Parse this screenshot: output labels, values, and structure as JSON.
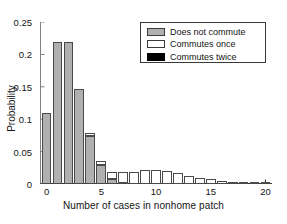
{
  "chart_data": {
    "type": "bar",
    "title": "",
    "subtitle": "",
    "xlabel": "Number of cases in nonhome patch",
    "ylabel": "Probability",
    "xlim": [
      -0.6,
      20.6
    ],
    "ylim": [
      0,
      0.25
    ],
    "xticks": [
      0,
      5,
      10,
      15,
      20
    ],
    "xticklabels": [
      "0",
      "5",
      "10",
      "15",
      "20"
    ],
    "yticks": [
      0,
      0.05,
      0.1,
      0.15,
      0.2,
      0.25
    ],
    "yticklabels": [
      "0",
      "0.05",
      "0.1",
      "0.15",
      "0.2",
      "0.25"
    ],
    "grid": false,
    "stacked": true,
    "legend_position": "upper right",
    "categories": [
      0,
      1,
      2,
      3,
      4,
      5,
      6,
      7,
      8,
      9,
      10,
      11,
      12,
      13,
      14,
      15,
      16,
      17,
      18,
      19,
      20
    ],
    "series": [
      {
        "name": "Does not commute",
        "color": "#b0b0b0",
        "values": [
          0.11,
          0.219,
          0.219,
          0.147,
          0.074,
          0.029,
          0.008,
          0.002,
          0.0,
          0.0,
          0.0,
          0.0,
          0.0,
          0.0,
          0.0,
          0.0,
          0.0,
          0.0,
          0.0,
          0.0,
          0.0
        ]
      },
      {
        "name": "Commutes once",
        "color": "#ffffff",
        "values": [
          0.0,
          0.0,
          0.0,
          0.0,
          0.004,
          0.007,
          0.01,
          0.016,
          0.019,
          0.022,
          0.022,
          0.02,
          0.017,
          0.013,
          0.01,
          0.007,
          0.004,
          0.003,
          0.002,
          0.001,
          0.001
        ]
      },
      {
        "name": "Commutes twice",
        "color": "#000000",
        "values": [
          0.0,
          0.0,
          0.0,
          0.0,
          0.0,
          0.0,
          0.0,
          0.0,
          0.0,
          0.0,
          0.0,
          0.0,
          0.0,
          0.0,
          0.0,
          0.0,
          0.0,
          0.0,
          0.0,
          0.0,
          0.0
        ]
      }
    ],
    "totals": [
      0.11,
      0.219,
      0.219,
      0.147,
      0.078,
      0.036,
      0.018,
      0.018,
      0.019,
      0.022,
      0.022,
      0.02,
      0.017,
      0.013,
      0.01,
      0.007,
      0.004,
      0.003,
      0.002,
      0.001,
      0.001
    ]
  },
  "legend": {
    "items": [
      {
        "label": "Does not commute",
        "swatch": "gray"
      },
      {
        "label": "Commutes once",
        "swatch": "white"
      },
      {
        "label": "Commutes twice",
        "swatch": "black"
      }
    ]
  }
}
